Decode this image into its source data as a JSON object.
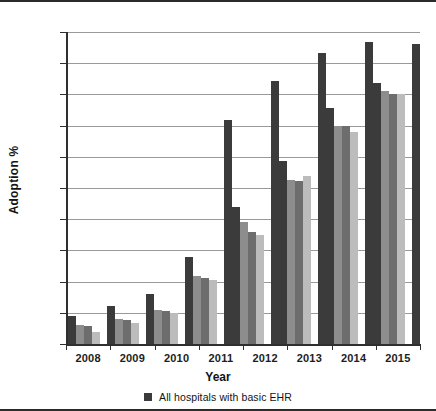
{
  "chart_data": {
    "type": "bar",
    "title": "",
    "xlabel": "Year",
    "ylabel": "Adoption %",
    "categories": [
      "2008",
      "2009",
      "2010",
      "2011",
      "2012",
      "2013",
      "2014",
      "2015"
    ],
    "ylim": [
      0,
      100
    ],
    "yticks": [
      0,
      10,
      20,
      30,
      40,
      50,
      60,
      70,
      80,
      90,
      100
    ],
    "grid": true,
    "legend_position": "bottom",
    "series": [
      {
        "name": "All hospitals with basic EHR",
        "color": "#3b3b3b",
        "values": [
          9.0,
          12.2,
          16.0,
          27.8,
          44.0,
          58.6,
          75.5,
          83.5
        ]
      },
      {
        "name": "series-2",
        "color": "#8d8d8d",
        "values": [
          6.0,
          8.1,
          11.0,
          21.7,
          39.0,
          52.5,
          70.0,
          81.0
        ]
      },
      {
        "name": "series-3",
        "color": "#6d6d6d",
        "values": [
          5.8,
          7.8,
          10.5,
          21.3,
          36.0,
          52.4,
          69.9,
          80.2
        ]
      },
      {
        "name": "series-4",
        "color": "#bcbcbc",
        "values": [
          3.9,
          6.8,
          10.0,
          20.4,
          35.0,
          53.7,
          67.8,
          80.0
        ]
      },
      {
        "name": "series-tall",
        "color": "#3b3b3b",
        "values": [
          null,
          null,
          null,
          71.8,
          84.3,
          93.3,
          96.7,
          96.2
        ]
      }
    ]
  },
  "axes": {
    "y_tick_labels": [
      "100",
      "90",
      "80",
      "70",
      "60",
      "50",
      "40",
      "30",
      "20",
      "10",
      "0"
    ],
    "y_axis_title": "Adoption %",
    "x_axis_title": "Year",
    "x_tick_labels": [
      "2008",
      "2009",
      "2010",
      "2011",
      "2012",
      "2013",
      "2014",
      "2015"
    ]
  },
  "legend": {
    "items": [
      {
        "label": "All hospitals with basic EHR",
        "color": "#3b3b3b",
        "marker": "square-marker"
      }
    ]
  },
  "colors": {
    "series_1": "#3b3b3b",
    "series_2": "#8d8d8d",
    "series_3": "#6d6d6d",
    "series_4": "#bcbcbc",
    "gridline": "#9a9a9a",
    "axis": "#2f2f2f",
    "text": "#131313",
    "background": "#ffffff"
  }
}
